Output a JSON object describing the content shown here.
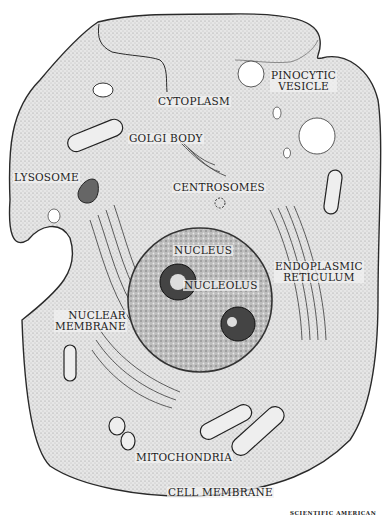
{
  "figure": {
    "type": "labeled cell diagram",
    "credit": "SCIENTIFIC AMERICAN"
  },
  "labels": {
    "pinocytic_vesicle": [
      "PINOCYTIC",
      "VESICLE"
    ],
    "cytoplasm": "CYTOPLASM",
    "golgi_body": "GOLGI BODY",
    "lysosome": "LYSOSOME",
    "centrosomes": "CENTROSOMES",
    "nucleus": "NUCLEUS",
    "nucleolus": "NUCLEOLUS",
    "endoplasmic_reticulum": [
      "ENDOPLASMIC",
      "RETICULUM"
    ],
    "nuclear_membrane": [
      "NUCLEAR",
      "MEMBRANE"
    ],
    "mitochondria": "MITOCHONDRIA",
    "cell_membrane": "CELL MEMBRANE"
  },
  "colors": {
    "cytoplasm_fill": "#e4e4e4",
    "outline": "#2a2a2a",
    "nucleus_fill": "#b9b9b9",
    "background": "#ffffff"
  }
}
